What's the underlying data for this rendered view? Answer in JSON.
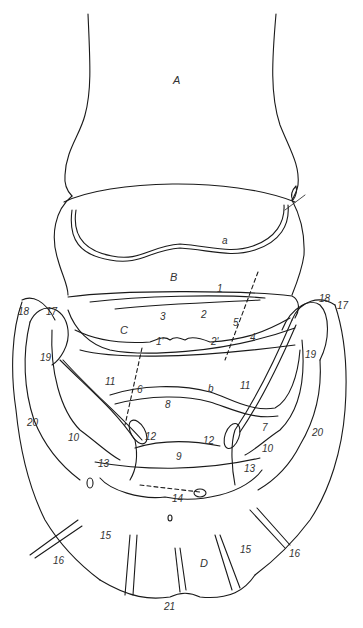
{
  "figure": {
    "line_color": "#1a1a1a",
    "label_color": "#333333",
    "region_labels": [
      {
        "id": "A",
        "text": "A",
        "x": 173,
        "y": 75
      },
      {
        "id": "B",
        "text": "B",
        "x": 170,
        "y": 272
      },
      {
        "id": "C",
        "text": "C",
        "x": 120,
        "y": 325
      },
      {
        "id": "D",
        "text": "D",
        "x": 200,
        "y": 558
      },
      {
        "id": "a",
        "text": "a",
        "x": 222,
        "y": 236
      },
      {
        "id": "b",
        "text": "b",
        "x": 208,
        "y": 394
      }
    ],
    "numbered_labels": [
      {
        "text": "1",
        "x": 217,
        "y": 287
      },
      {
        "text": "1'",
        "x": 156,
        "y": 339
      },
      {
        "text": "2",
        "x": 201,
        "y": 311
      },
      {
        "text": "2'",
        "x": 211,
        "y": 339
      },
      {
        "text": "3",
        "x": 160,
        "y": 313
      },
      {
        "text": "4",
        "x": 250,
        "y": 335
      },
      {
        "text": "5",
        "x": 233,
        "y": 320
      },
      {
        "text": "6",
        "x": 137,
        "y": 387
      },
      {
        "text": "7",
        "x": 262,
        "y": 428
      },
      {
        "text": "8",
        "x": 165,
        "y": 404
      },
      {
        "text": "9",
        "x": 176,
        "y": 452
      },
      {
        "text": "10",
        "x": 68,
        "y": 435
      },
      {
        "text": "10",
        "x": 262,
        "y": 446
      },
      {
        "text": "11",
        "x": 105,
        "y": 379
      },
      {
        "text": "11",
        "x": 240,
        "y": 383
      },
      {
        "text": "12",
        "x": 145,
        "y": 433
      },
      {
        "text": "12",
        "x": 203,
        "y": 438
      },
      {
        "text": "13",
        "x": 98,
        "y": 461
      },
      {
        "text": "13",
        "x": 244,
        "y": 466
      },
      {
        "text": "14",
        "x": 172,
        "y": 496
      },
      {
        "text": "15",
        "x": 100,
        "y": 533
      },
      {
        "text": "15",
        "x": 240,
        "y": 547
      },
      {
        "text": "16",
        "x": 53,
        "y": 558
      },
      {
        "text": "16",
        "x": 289,
        "y": 551
      },
      {
        "text": "17",
        "x": 46,
        "y": 310
      },
      {
        "text": "17",
        "x": 337,
        "y": 304
      },
      {
        "text": "18",
        "x": 18,
        "y": 310
      },
      {
        "text": "18",
        "x": 319,
        "y": 297
      },
      {
        "text": "19",
        "x": 40,
        "y": 356
      },
      {
        "text": "19",
        "x": 305,
        "y": 353
      },
      {
        "text": "20",
        "x": 27,
        "y": 420
      },
      {
        "text": "20",
        "x": 312,
        "y": 430
      },
      {
        "text": "21",
        "x": 164,
        "y": 604
      }
    ]
  }
}
